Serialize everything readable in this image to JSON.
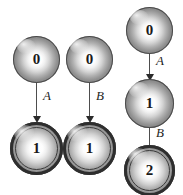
{
  "figure": {
    "type": "state-transition-diagram",
    "background_color": "#ffffff",
    "node_fill_color": "#b0b0b0",
    "node_outline_color": "#2e2e2e",
    "arrow_color": "#2b2b2b",
    "label_color": "#1a1a1a"
  },
  "groups": [
    {
      "id": "left",
      "nodes": [
        {
          "id": "left-start",
          "label": "0",
          "accepting": false
        },
        {
          "id": "left-end",
          "label": "1",
          "accepting": true
        }
      ],
      "transitions": [
        {
          "id": "left-a",
          "label": "A",
          "from": "left-start",
          "to": "left-end"
        }
      ]
    },
    {
      "id": "middle",
      "nodes": [
        {
          "id": "middle-start",
          "label": "0",
          "accepting": false
        },
        {
          "id": "middle-end",
          "label": "1",
          "accepting": true
        }
      ],
      "transitions": [
        {
          "id": "middle-b",
          "label": "B",
          "from": "middle-start",
          "to": "middle-end"
        }
      ]
    },
    {
      "id": "right",
      "nodes": [
        {
          "id": "right-start",
          "label": "0",
          "accepting": false
        },
        {
          "id": "right-mid",
          "label": "1",
          "accepting": false
        },
        {
          "id": "right-end",
          "label": "2",
          "accepting": true
        }
      ],
      "transitions": [
        {
          "id": "right-a",
          "label": "A",
          "from": "right-start",
          "to": "right-mid"
        },
        {
          "id": "right-b",
          "label": "B",
          "from": "right-mid",
          "to": "right-end"
        }
      ]
    }
  ]
}
